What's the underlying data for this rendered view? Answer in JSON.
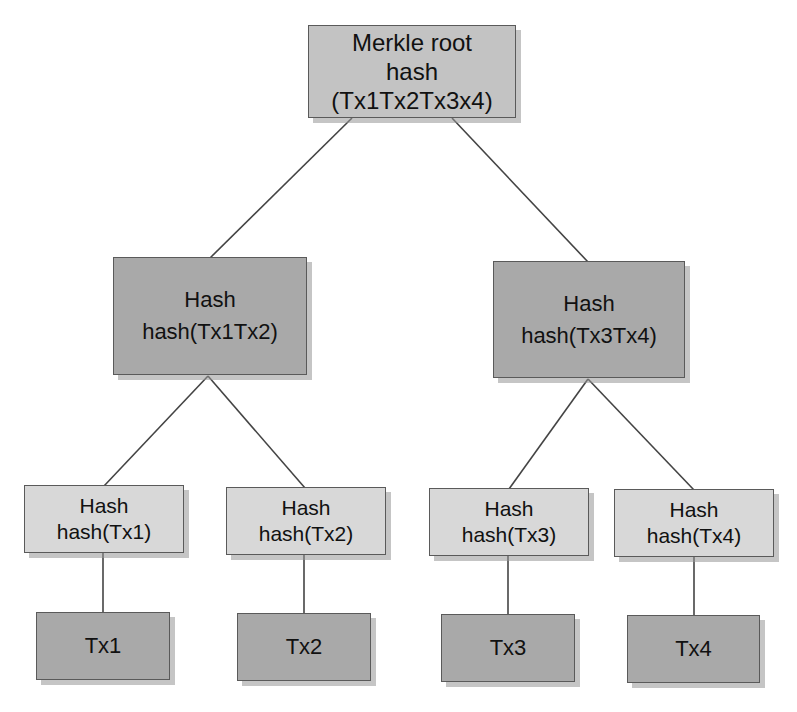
{
  "diagram": {
    "colors": {
      "root_fill": "#c3c3c3",
      "mid_fill": "#a9a9a9",
      "leaf_hash_fill": "#d8d8d8",
      "tx_fill": "#a9a9a9",
      "border": "#5a5a5a",
      "edge": "#444444"
    },
    "root": {
      "line1": "Merkle root",
      "line2": "hash",
      "line3": "(Tx1Tx2Tx3x4)"
    },
    "level2": [
      {
        "line1": "Hash",
        "line2": "hash(Tx1Tx2)"
      },
      {
        "line1": "Hash",
        "line2": "hash(Tx3Tx4)"
      }
    ],
    "level3": [
      {
        "line1": "Hash",
        "line2": "hash(Tx1)"
      },
      {
        "line1": "Hash",
        "line2": "hash(Tx2)"
      },
      {
        "line1": "Hash",
        "line2": "hash(Tx3)"
      },
      {
        "line1": "Hash",
        "line2": "hash(Tx4)"
      }
    ],
    "transactions": [
      {
        "label": "Tx1"
      },
      {
        "label": "Tx2"
      },
      {
        "label": "Tx3"
      },
      {
        "label": "Tx4"
      }
    ],
    "edges": [
      {
        "from": "root",
        "to": "level2.0"
      },
      {
        "from": "root",
        "to": "level2.1"
      },
      {
        "from": "level2.0",
        "to": "level3.0"
      },
      {
        "from": "level2.0",
        "to": "level3.1"
      },
      {
        "from": "level2.1",
        "to": "level3.2"
      },
      {
        "from": "level2.1",
        "to": "level3.3"
      },
      {
        "from": "level3.0",
        "to": "transactions.0"
      },
      {
        "from": "level3.1",
        "to": "transactions.1"
      },
      {
        "from": "level3.2",
        "to": "transactions.2"
      },
      {
        "from": "level3.3",
        "to": "transactions.3"
      }
    ]
  }
}
